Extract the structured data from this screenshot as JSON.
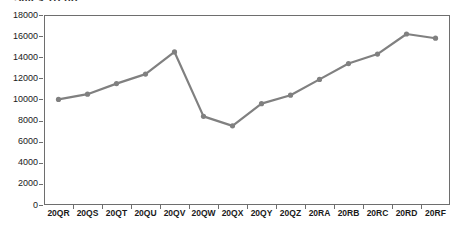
{
  "chart_data": {
    "type": "line",
    "title": "Sales Trend",
    "xlabel": "",
    "ylabel": "",
    "ylim": [
      0,
      18000
    ],
    "ytick_step": 2000,
    "yticks": [
      "18000",
      "16000",
      "14000",
      "12000",
      "10000",
      "8000",
      "6000",
      "4000",
      "2000",
      "0"
    ],
    "grid": false,
    "legend": "none",
    "line_color": "#808080",
    "marker_color": "#808080",
    "axis_color": "#6e6e6e",
    "categories": [
      "20QR",
      "20QS",
      "20QT",
      "20QU",
      "20QV",
      "20QW",
      "20QX",
      "20QY",
      "20QZ",
      "20RA",
      "20RB",
      "20RC",
      "20RD",
      "20RF"
    ],
    "series": [
      {
        "name": "Series 1",
        "values": [
          10000,
          10500,
          11500,
          12400,
          14500,
          8400,
          7500,
          9600,
          10400,
          11900,
          13400,
          14300,
          16200,
          15800
        ]
      }
    ]
  }
}
